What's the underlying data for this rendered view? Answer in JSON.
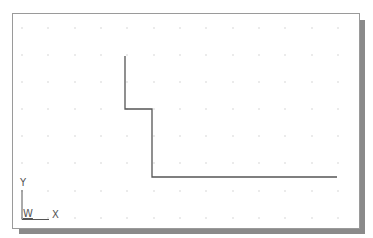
{
  "drawing": {
    "background_color": "#ffffff",
    "frame_border_color": "#9a9a9a",
    "shadow_color": "#8a8a8a",
    "line_color": "#555555",
    "grid_dot_color": "#b0b0b0",
    "grid": {
      "columns_x": [
        22,
        48,
        75,
        101,
        127,
        154,
        180,
        206,
        233,
        259,
        285,
        312,
        338
      ],
      "rows_y": [
        28,
        55,
        82,
        109,
        136,
        163,
        191,
        218
      ]
    },
    "polyline": {
      "points": [
        [
          125,
          56
        ],
        [
          125,
          109
        ],
        [
          152,
          109
        ],
        [
          152,
          177
        ],
        [
          337,
          177
        ]
      ]
    }
  },
  "ucs_icon": {
    "y_label": "Y",
    "x_label": "X",
    "w_label": "W"
  }
}
